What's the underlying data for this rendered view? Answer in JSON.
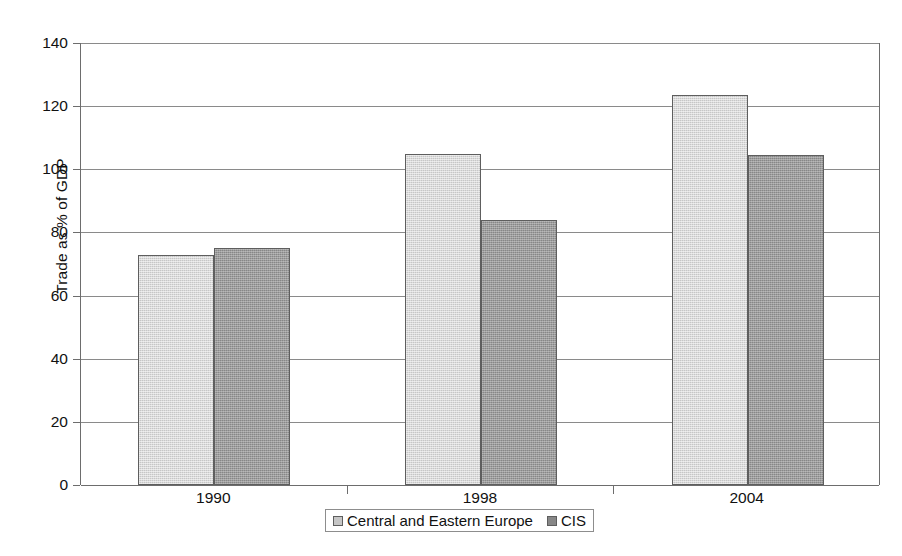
{
  "chart_data": {
    "type": "bar",
    "title": "",
    "subtitle": "",
    "xlabel": "",
    "ylabel": "Trade as % of GDP",
    "categories": [
      "1990",
      "1998",
      "2004"
    ],
    "series": [
      {
        "name": "Central and Eastern Europe",
        "color": "#c6c6c6",
        "values": [
          73,
          105,
          123.5
        ]
      },
      {
        "name": "CIS",
        "color": "#878787",
        "values": [
          75,
          84,
          104.5
        ]
      }
    ],
    "ylim": [
      0,
      140
    ],
    "ytick_step": 20,
    "yticks": [
      0,
      20,
      40,
      60,
      80,
      100,
      120,
      140
    ],
    "ytick_labels": [
      "0",
      "20",
      "40",
      "60",
      "80",
      "100",
      "120",
      "140"
    ],
    "grid": true,
    "grid_axis": "y",
    "legend": true,
    "legend_position": "bottom-center",
    "legend_bordered": true,
    "data_labels": false,
    "bar_border_color": "#5e5e5e",
    "axis_color": "#6d6d6d",
    "gridline_color": "#8a8a8a",
    "background": "#ffffff"
  }
}
